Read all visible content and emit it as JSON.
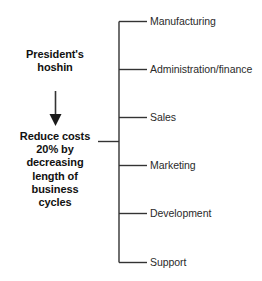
{
  "diagram": {
    "type": "hoshin-deployment-tree",
    "source": {
      "label_line1": "President's",
      "label_line2": "hoshin"
    },
    "arrow": {
      "name": "down-arrow-icon",
      "direction": "down"
    },
    "goal": {
      "lines": [
        "Reduce costs",
        "20% by",
        "decreasing",
        "length of",
        "business",
        "cycles"
      ],
      "full_text": "Reduce costs 20% by decreasing length of business cycles"
    },
    "branches": [
      {
        "label": "Manufacturing"
      },
      {
        "label": "Administration/finance"
      },
      {
        "label": "Sales"
      },
      {
        "label": "Marketing"
      },
      {
        "label": "Development"
      },
      {
        "label": "Support"
      }
    ],
    "colors": {
      "background": "#ffffff",
      "line": "#333333",
      "goal_text": "#111111",
      "branch_text": "#2a2a2a"
    }
  }
}
